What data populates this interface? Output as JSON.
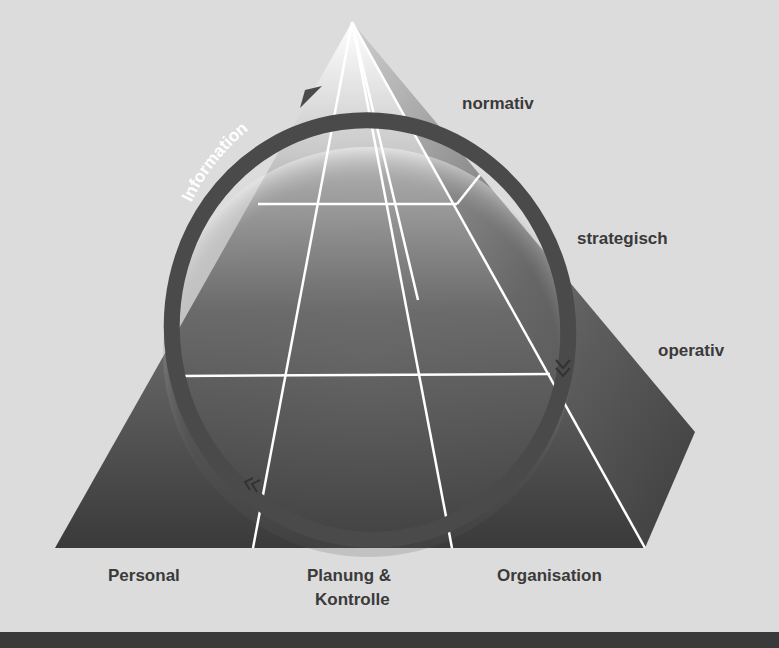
{
  "diagram": {
    "type": "management-pyramid",
    "ring_label": "Information",
    "levels": [
      {
        "label": "normativ"
      },
      {
        "label": "strategisch"
      },
      {
        "label": "operativ"
      }
    ],
    "dimensions": [
      {
        "label": "Personal"
      },
      {
        "label": "Planung &"
      },
      {
        "label": "Kontrolle"
      },
      {
        "label": "Organisation"
      }
    ],
    "colors": {
      "background": "#dcdcdc",
      "pyramid_dark": "#3c3c3c",
      "ring": "#4a4a4a",
      "grid_lines": "#ffffff",
      "text": "#3a3a3a",
      "bottom_bar": "#3a3a3a"
    }
  }
}
